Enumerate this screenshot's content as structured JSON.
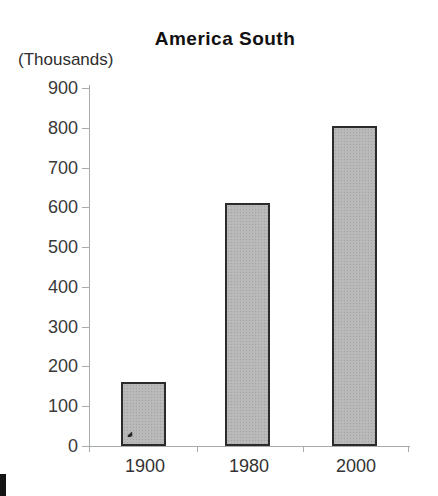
{
  "chart_data": {
    "type": "bar",
    "title": "America South",
    "ylabel": "(Thousands)",
    "xlabel": "",
    "categories": [
      "1900",
      "1980",
      "2000"
    ],
    "values": [
      160,
      610,
      805
    ],
    "ylim": [
      0,
      900
    ],
    "ytick_interval": 100,
    "yticks": [
      "900",
      "800",
      "700",
      "600",
      "500",
      "400",
      "300",
      "200",
      "100",
      "0"
    ],
    "grid": "off",
    "legend": "none",
    "colors": {
      "bar_fill": "#b9b9b9",
      "bar_border": "#2b2b2b",
      "axis": "#a6abab",
      "label_text": "#3a3a3a",
      "title_text": "#111111",
      "background": "#ffffff"
    }
  }
}
